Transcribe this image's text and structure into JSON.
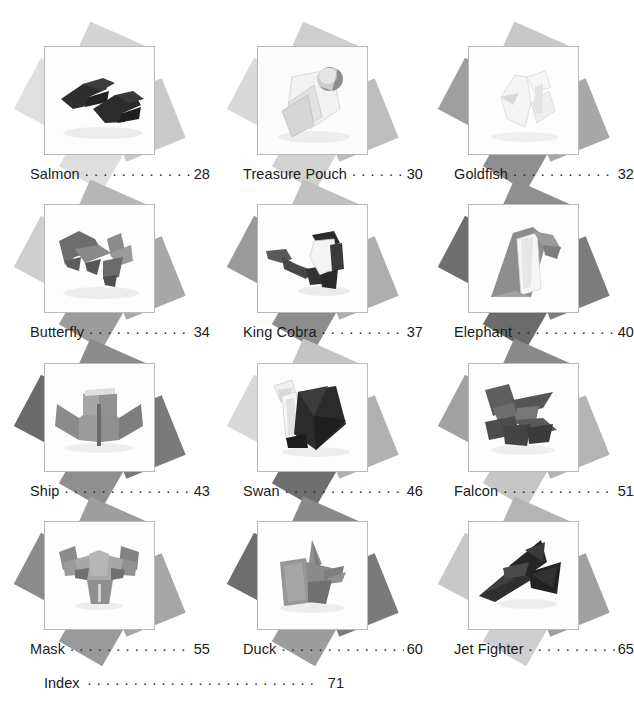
{
  "page": {
    "type": "table-of-contents",
    "book_topic": "origami models",
    "background_color": "#ffffff",
    "text_color": "#1a1a1a"
  },
  "entries": [
    {
      "title": "Salmon",
      "page": "28",
      "leader": ". . . . . .",
      "photo_name": "salmon-origami-photo",
      "model": "two dark folded paper fish"
    },
    {
      "title": "Treasure Pouch",
      "page": "30",
      "leader": ". .",
      "photo_name": "treasure-pouch-origami-photo",
      "model": "white folded pouch with dark rounded clasp"
    },
    {
      "title": "Goldfish",
      "page": "32",
      "leader": ". . . . .",
      "photo_name": "goldfish-origami-photo",
      "model": "pale white folded goldfish"
    },
    {
      "title": "Butterfly",
      "page": "34",
      "leader": ". . . . .",
      "photo_name": "butterfly-origami-photo",
      "model": "two grey folded butterflies"
    },
    {
      "title": "King Cobra",
      "page": "37",
      "leader": ". .",
      "photo_name": "king-cobra-origami-photo",
      "model": "dark grey folded cobra with raised hood"
    },
    {
      "title": "Elephant",
      "page": "40",
      "leader": ". . . . .",
      "photo_name": "elephant-origami-photo",
      "model": "grey and white folded elephant"
    },
    {
      "title": "Ship",
      "page": "43",
      "leader": ". . . . . . .",
      "photo_name": "ship-origami-photo",
      "model": "grey folded ship with open sails"
    },
    {
      "title": "Swan",
      "page": "46",
      "leader": ". . . . . . .",
      "photo_name": "swan-origami-photo",
      "model": "white and black folded swan"
    },
    {
      "title": "Falcon",
      "page": "51",
      "leader": ". . . . . . .",
      "photo_name": "falcon-origami-photo",
      "model": "dark grey folded falcon in flight"
    },
    {
      "title": "Mask",
      "page": "55",
      "leader": ". . . . . . .",
      "photo_name": "mask-origami-photo",
      "model": "grey folded horned bull mask"
    },
    {
      "title": "Duck",
      "page": "60",
      "leader": ". . . . . . .",
      "photo_name": "duck-origami-photo",
      "model": "grey folded duck"
    },
    {
      "title": "Jet Fighter",
      "page": "65",
      "leader": ". . .",
      "photo_name": "jet-fighter-origami-photo",
      "model": "black folded jet fighter plane"
    }
  ],
  "index": {
    "title": "Index",
    "page": "71",
    "leader": ". . . . . . . . . . . . . . . . . . . . . . ."
  },
  "colors": {
    "frame_border": "#b9b9b9",
    "paper_light": "#dcdcdc",
    "paper_mid": "#b3b3b3",
    "paper_dark": "#808080",
    "paper_darkest": "#6b6b6b"
  }
}
